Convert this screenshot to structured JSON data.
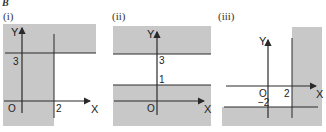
{
  "section_letter": "B",
  "shade_color": "#c8c8c8",
  "line_color": "#2a2a2a",
  "panels": [
    {
      "label": "(i)",
      "axis_x": "X",
      "axis_y": "Y",
      "origin": "O",
      "ticks": {
        "x": "2",
        "y": "3"
      },
      "description": "Shaded region: x ≤ 2 or y ≥ 3"
    },
    {
      "label": "(ii)",
      "axis_x": "X",
      "axis_y": "Y",
      "origin": "O",
      "ticks": {
        "y_upper": "3",
        "y_lower": "1"
      },
      "description": "Shaded region: y ≥ 3 or y ≤ 1"
    },
    {
      "label": "(iii)",
      "axis_x": "X",
      "axis_y": "Y",
      "origin": "O",
      "ticks": {
        "x": "2",
        "y": "−2"
      },
      "description": "Shaded region: x ≥ 2 or y ≤ −2"
    }
  ]
}
